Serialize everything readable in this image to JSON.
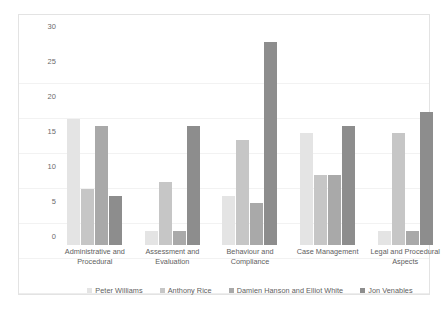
{
  "chart_data": {
    "type": "bar",
    "title": "",
    "subtitle": "",
    "xlabel": "",
    "ylabel": "",
    "ylim": [
      0,
      30
    ],
    "yticks": [
      0,
      5,
      10,
      15,
      20,
      25,
      30
    ],
    "ytick_labels": [
      "0",
      "5",
      "10",
      "15",
      "20",
      "25",
      "30"
    ],
    "grid": true,
    "legend_position": "bottom",
    "categories": [
      "Administrative and Procedural",
      "Assessment and Evaluation",
      "Behaviour and Compliance",
      "Case Management",
      "Legal and Procedural Aspects"
    ],
    "series": [
      {
        "name": "Peter Williams",
        "color": "#e4e4e4",
        "values": [
          18,
          2,
          7,
          16,
          2
        ]
      },
      {
        "name": "Anthony Rice",
        "color": "#c6c6c6",
        "values": [
          8,
          9,
          15,
          10,
          16
        ]
      },
      {
        "name": "Damien Hanson and Elliot White",
        "color": "#a9a9a9",
        "values": [
          17,
          2,
          6,
          10,
          2
        ]
      },
      {
        "name": "Jon Venables",
        "color": "#8d8d8d",
        "values": [
          7,
          17,
          29,
          17,
          19
        ]
      }
    ]
  },
  "style": {
    "plot_background": "#ffffff",
    "frame_border": "#e3e3e3",
    "gridline_color": "#f2f2f2",
    "axis_text_color": "#5e5e5e"
  }
}
